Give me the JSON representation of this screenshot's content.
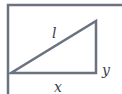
{
  "diagram": {
    "type": "right-triangle-in-frame",
    "labels": {
      "hypotenuse": "l",
      "vertical_leg": "y",
      "horizontal_leg": "x"
    },
    "colors": {
      "stroke": "#6b7280",
      "label": "#3a3d4a",
      "background": "#ffffff"
    }
  }
}
